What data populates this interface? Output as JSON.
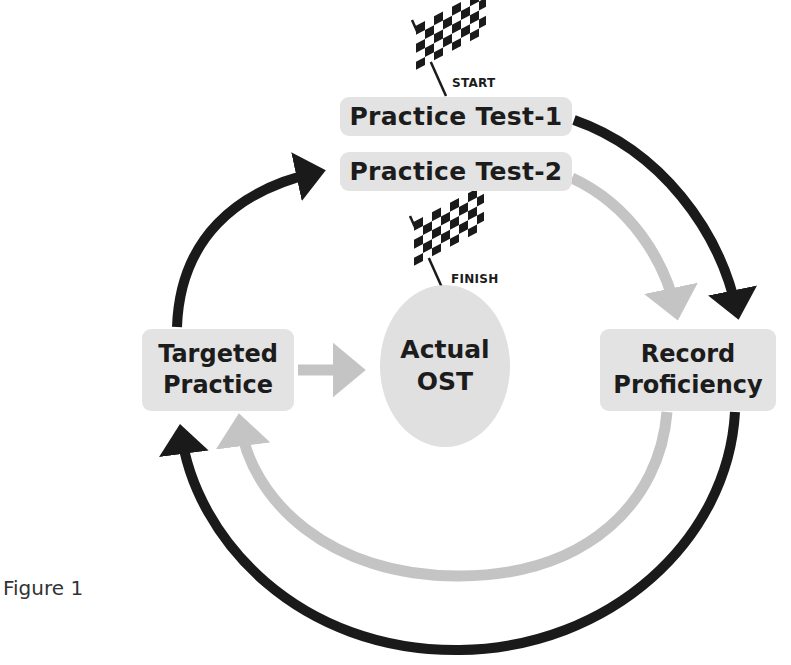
{
  "diagram": {
    "nodes": {
      "practice_test_1": "Practice Test-1",
      "practice_test_2": "Practice Test-2",
      "targeted_practice": [
        "Targeted",
        "Practice"
      ],
      "actual_ost": [
        "Actual",
        "OST"
      ],
      "record_proficiency": [
        "Record",
        "Proficiency"
      ]
    },
    "flags": {
      "start": "START",
      "finish": "FINISH"
    },
    "edges": [
      {
        "from": "Practice Test-1",
        "to": "Record Proficiency",
        "color": "#1a1a1a"
      },
      {
        "from": "Record Proficiency",
        "to": "Targeted Practice",
        "color": "#1a1a1a"
      },
      {
        "from": "Targeted Practice",
        "to": "Practice Test-2",
        "color": "#1a1a1a"
      },
      {
        "from": "Practice Test-2",
        "to": "Record Proficiency",
        "color": "#c4c4c4"
      },
      {
        "from": "Record Proficiency",
        "to": "Targeted Practice",
        "color": "#c4c4c4"
      },
      {
        "from": "Targeted Practice",
        "to": "Actual OST",
        "color": "#c4c4c4"
      }
    ],
    "colors": {
      "dark_arrow": "#1a1a1a",
      "light_arrow": "#c4c4c4",
      "box_fill": "#e3e3e3"
    }
  },
  "caption": "Figure 1"
}
